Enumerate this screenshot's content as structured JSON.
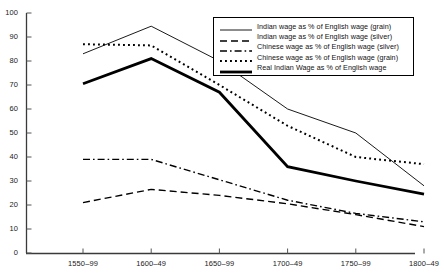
{
  "chart_data": {
    "type": "line",
    "title": "",
    "xlabel": "",
    "ylabel": "",
    "categories": [
      "1550–99",
      "1600–49",
      "1650–99",
      "1700–49",
      "1750–99",
      "1800–49"
    ],
    "ylim": [
      0,
      100
    ],
    "yticks": [
      0,
      10,
      20,
      30,
      40,
      50,
      60,
      70,
      80,
      90,
      100
    ],
    "grid": false,
    "legend_position": "top-right",
    "series": [
      {
        "name": "Indian wage as % of English wage (grain)",
        "style": "solid-thin",
        "color": "#000000",
        "values": [
          83,
          94.5,
          80,
          60,
          50,
          28
        ]
      },
      {
        "name": "Indian wage as % of English wage (silver)",
        "style": "dashed",
        "color": "#000000",
        "values": [
          21,
          26.5,
          24,
          20.5,
          16,
          11
        ]
      },
      {
        "name": "Chinese wage as % of English wage (silver)",
        "style": "dash-dot",
        "color": "#000000",
        "values": [
          39,
          39,
          30.5,
          22,
          16.5,
          13
        ]
      },
      {
        "name": "Chinese wage as % of English wage (grain)",
        "style": "dotted",
        "color": "#000000",
        "values": [
          87,
          86.5,
          70,
          53,
          40,
          37
        ]
      },
      {
        "name": "Real Indian Wage as % of English wage",
        "style": "solid-thick",
        "color": "#000000",
        "values": [
          70.5,
          81,
          67,
          36,
          30,
          24.5
        ]
      }
    ]
  },
  "axis": {
    "y_tick_labels": [
      "100",
      "90",
      "80",
      "70",
      "60",
      "50",
      "40",
      "30",
      "20",
      "10",
      "0"
    ],
    "x_tick_labels": [
      "1550–99",
      "1600–49",
      "1650–99",
      "1700–49",
      "1750–99",
      "1800–49"
    ]
  },
  "legend": {
    "items": [
      {
        "label": "Indian wage as % of English wage (grain)",
        "style": "solid-thin"
      },
      {
        "label": "Indian wage as % of English wage (silver)",
        "style": "dashed"
      },
      {
        "label": "Chinese wage as % of English wage (silver)",
        "style": "dash-dot"
      },
      {
        "label": "Chinese wage as % of English wage (grain)",
        "style": "dotted"
      },
      {
        "label": "Real Indian Wage as % of English wage",
        "style": "solid-thick"
      }
    ]
  }
}
